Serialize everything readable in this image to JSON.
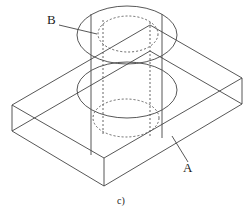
{
  "diagram": {
    "labels": {
      "b": "B",
      "a": "A"
    },
    "caption": "c)",
    "elements": {
      "box": "rectangular block (part A) shown in isometric wireframe",
      "cylinder": "cylinder (part B) passing through block, with coaxial hidden inner hole shown dashed"
    },
    "colors": {
      "line": "#444444",
      "background": "#ffffff"
    }
  }
}
